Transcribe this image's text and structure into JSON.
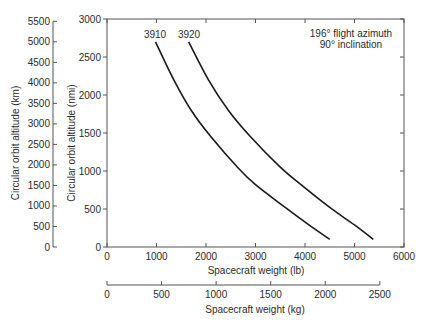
{
  "chart_data": {
    "type": "line",
    "title": "",
    "annotation": [
      "196° flight azimuth",
      "90° inclination"
    ],
    "xlabel": "Spacecraft weight (lb)",
    "xlabel_secondary": "Spacecraft weight (kg)",
    "ylabel": "Circular orbit altitude (nmi)",
    "ylabel_secondary": "Circular orbit altitude (km)",
    "xlim": [
      0,
      6000
    ],
    "ylim": [
      0,
      3000
    ],
    "x_ticks": [
      0,
      1000,
      2000,
      3000,
      4000,
      5000,
      6000
    ],
    "y_ticks": [
      0,
      500,
      1000,
      1500,
      2000,
      2500,
      3000
    ],
    "x2_ticks": [
      0,
      500,
      1000,
      1500,
      2000,
      2500
    ],
    "y2_ticks": [
      0,
      500,
      1000,
      1500,
      2000,
      2500,
      3000,
      3500,
      4000,
      4500,
      5000,
      5500
    ],
    "grid": false,
    "legend": "inline labels at curve tops",
    "series": [
      {
        "name": "3910",
        "x": [
          980,
          1350,
          1700,
          2100,
          2650,
          3000,
          3600,
          4100,
          4500
        ],
        "y": [
          2700,
          2200,
          1800,
          1450,
          1040,
          820,
          520,
          280,
          100
        ]
      },
      {
        "name": "3920",
        "x": [
          1650,
          2050,
          2450,
          2900,
          3500,
          3900,
          4500,
          5000,
          5380
        ],
        "y": [
          2700,
          2200,
          1800,
          1450,
          1050,
          830,
          520,
          290,
          100
        ]
      }
    ]
  },
  "labels": {
    "series_1": "3910",
    "series_2": "3920",
    "annotation_line_1": "196° flight azimuth",
    "annotation_line_2": "90° inclination",
    "xlabel": "Spacecraft weight (lb)",
    "xlabel_kg": "Spacecraft weight (kg)",
    "ylabel_nmi": "Circular orbit altitude (nmi)",
    "ylabel_km": "Circular orbit altitude (km)"
  }
}
